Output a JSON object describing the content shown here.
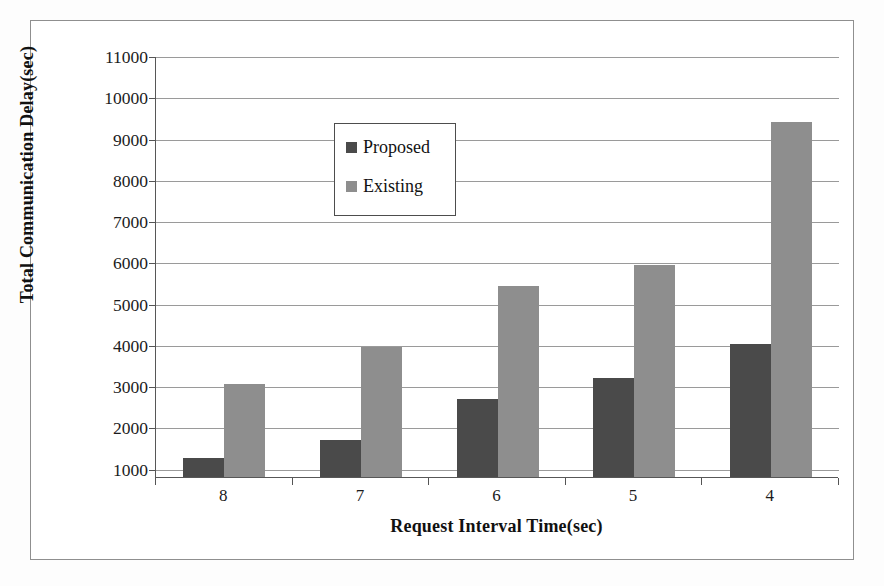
{
  "chart_data": {
    "type": "bar",
    "title": "",
    "xlabel": "Request Interval Time(sec)",
    "ylabel": "Total Communication Delay(sec)",
    "categories": [
      "8",
      "7",
      "6",
      "5",
      "4"
    ],
    "series": [
      {
        "name": "Proposed",
        "color": "#4a4a4a",
        "values": [
          1250,
          1700,
          2700,
          3200,
          4020
        ]
      },
      {
        "name": "Existing",
        "color": "#8e8e8e",
        "values": [
          3050,
          3950,
          5420,
          5930,
          9400
        ]
      }
    ],
    "ylim": [
      800,
      11000
    ],
    "yticks": [
      1000,
      2000,
      3000,
      4000,
      5000,
      6000,
      7000,
      8000,
      9000,
      10000,
      11000
    ],
    "ytick_labels": [
      "1000",
      "2000",
      "3000",
      "4000",
      "5000",
      "6000",
      "7000",
      "8000",
      "9000",
      "10000",
      "11000"
    ],
    "grid": true,
    "legend_position": "top-left",
    "legend_entries": [
      "Proposed",
      "Existing"
    ]
  },
  "figure": {
    "background_color": "#ffffff",
    "border_color": "#8f8f8f",
    "axis_color": "#575757",
    "gridline_color": "#9a9a9a"
  }
}
